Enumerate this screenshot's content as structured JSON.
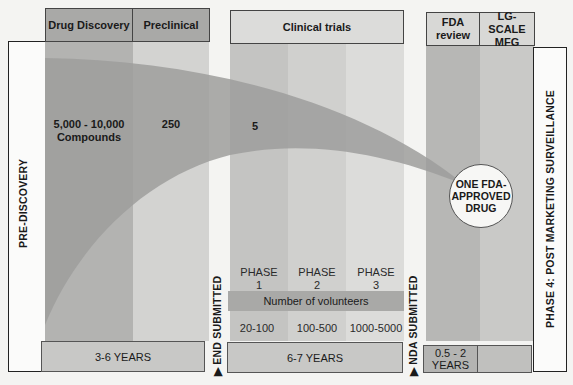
{
  "stages": {
    "drug_discovery": {
      "label": "Drug Discovery",
      "count": "5,000 - 10,000",
      "count_sub": "Compounds"
    },
    "preclinical": {
      "label": "Preclinical",
      "count": "250"
    },
    "clinical_trials": {
      "label": "Clinical trials",
      "count": "5"
    },
    "fda_review": {
      "label_line1": "FDA",
      "label_line2": "review"
    },
    "lg_scale_mfg": {
      "label_line1": "LG-SCALE",
      "label_line2": "MFG"
    }
  },
  "side_labels": {
    "pre_discovery": "PRE-DISCOVERY",
    "post_marketing": "PHASE 4: POST MARKETING SURVEILLANCE",
    "end_submitted": "END SUBMITTED",
    "nda_submitted": "NDA SUBMITTED"
  },
  "phases": [
    {
      "line1": "PHASE",
      "line2": "1",
      "volunteers": "20-100"
    },
    {
      "line1": "PHASE",
      "line2": "2",
      "volunteers": "100-500"
    },
    {
      "line1": "PHASE",
      "line2": "3",
      "volunteers": "1000-5000"
    }
  ],
  "volunteers_label": "Number of volunteers",
  "durations": {
    "discovery_preclinical": "3-6 YEARS",
    "clinical": "6-7 YEARS",
    "fda_line1": "0.5 - 2",
    "fda_line2": "YEARS"
  },
  "result": {
    "line1": "ONE FDA-",
    "line2": "APPROVED",
    "line3": "DRUG"
  },
  "colors": {
    "dark_gray": "#a9a9a7",
    "mid_gray": "#c2c2c0",
    "light_gray": "#d8d8d6",
    "lighter_gray": "#e2e2e0",
    "funnel": "#9b9b99",
    "background": "#f4f4f2"
  }
}
